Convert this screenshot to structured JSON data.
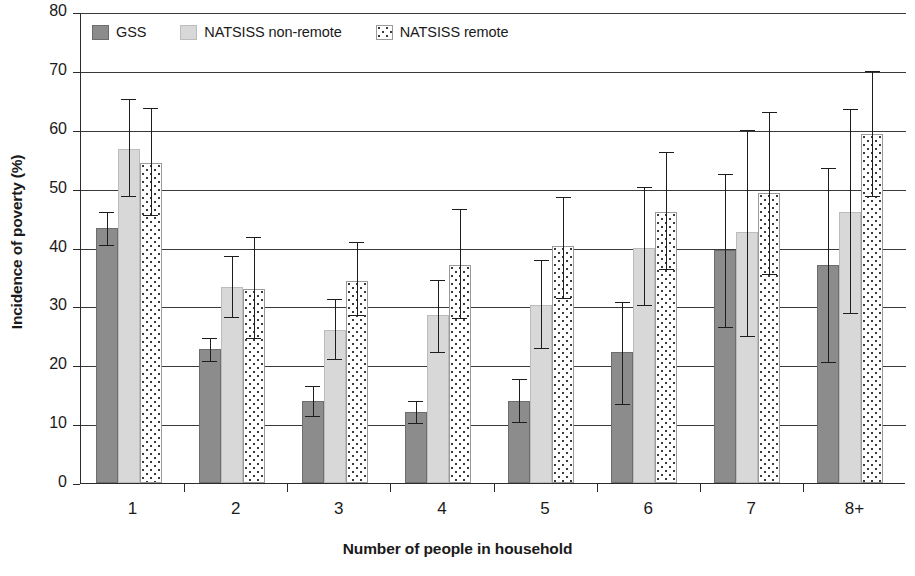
{
  "chart_data": {
    "type": "bar",
    "title": "",
    "xlabel": "Number of people in household",
    "ylabel": "Incidence of poverty (%)",
    "categories": [
      "1",
      "2",
      "3",
      "4",
      "5",
      "6",
      "7",
      "8+"
    ],
    "ylim": [
      0,
      80
    ],
    "yticks": [
      0,
      10,
      20,
      30,
      40,
      50,
      60,
      70,
      80
    ],
    "ytick_labels": [
      "0",
      "10",
      "20",
      "30",
      "40",
      "50",
      "60",
      "70",
      "80"
    ],
    "grid": true,
    "legend_position": "top-left",
    "error_bars": true,
    "series": [
      {
        "name": "GSS",
        "color": "#8c8c8c",
        "pattern": "solid-medium-gray",
        "values": [
          43.3,
          22.7,
          14.0,
          12.0,
          14.0,
          22.3,
          39.5,
          37.0
        ],
        "err_low": [
          40.5,
          20.8,
          11.3,
          10.2,
          10.3,
          13.5,
          26.5,
          20.5
        ],
        "err_high": [
          46.0,
          24.7,
          16.5,
          14.0,
          17.7,
          30.8,
          52.5,
          53.5
        ]
      },
      {
        "name": "NATSISS non-remote",
        "color": "#d8d8d8",
        "pattern": "solid-light-gray",
        "values": [
          56.8,
          33.3,
          26.0,
          28.5,
          30.3,
          40.0,
          42.7,
          46.0
        ],
        "err_low": [
          48.7,
          28.2,
          21.0,
          22.3,
          23.0,
          30.3,
          25.0,
          28.8
        ],
        "err_high": [
          65.2,
          38.5,
          31.3,
          34.5,
          37.8,
          50.3,
          60.0,
          63.5
        ]
      },
      {
        "name": "NATSISS remote",
        "color": "#ffffff",
        "pattern": "dotted-white",
        "values": [
          54.4,
          33.0,
          34.3,
          37.0,
          40.2,
          46.0,
          49.2,
          59.2
        ],
        "err_low": [
          45.5,
          24.7,
          28.5,
          28.0,
          31.5,
          36.3,
          35.5,
          48.8
        ],
        "err_high": [
          63.7,
          41.8,
          41.0,
          46.5,
          48.5,
          56.3,
          63.0,
          70.0
        ]
      }
    ]
  },
  "legend": {
    "items": [
      {
        "label": "GSS",
        "swatch": "gss"
      },
      {
        "label": "NATSISS non-remote",
        "swatch": "nonremote"
      },
      {
        "label": "NATSISS remote",
        "swatch": "remote"
      }
    ]
  }
}
